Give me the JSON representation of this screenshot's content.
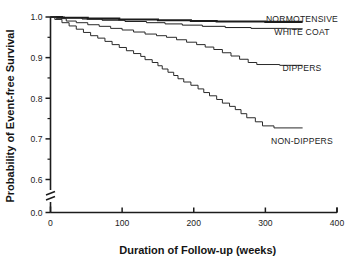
{
  "chart_data": {
    "type": "line",
    "subtype": "kaplan-meier-step",
    "title": "",
    "xlabel": "Duration of Follow-up (weeks)",
    "ylabel": "Probability of Event-free Survival",
    "xlim": [
      0,
      400
    ],
    "ylim": [
      0.55,
      1.0
    ],
    "xticks": [
      0,
      100,
      200,
      300,
      400
    ],
    "xticklabels": [
      "0",
      "100",
      "200",
      "300",
      "400"
    ],
    "yticks": [
      0.6,
      0.7,
      0.8,
      0.9,
      1.0
    ],
    "yticklabels": [
      "0.6",
      "0.7",
      "0.8",
      "0.9",
      "1.0"
    ],
    "y_minor_ticks": [
      0.65,
      0.75,
      0.85,
      0.95
    ],
    "y_axis_break": true,
    "y_break_label": "0.0",
    "grid": false,
    "legend_position": "inline-right-of-curves",
    "series": [
      {
        "name": "NORMOTENSIVE",
        "label": "NORMOTENSIVE",
        "color": "#1c1c1c",
        "linewidth": 2.1,
        "label_x": 302,
        "label_y": 0.995,
        "points": [
          [
            0,
            1.0
          ],
          [
            16,
            1.0
          ],
          [
            16,
            0.998
          ],
          [
            52,
            0.998
          ],
          [
            52,
            0.996
          ],
          [
            96,
            0.996
          ],
          [
            96,
            0.994
          ],
          [
            150,
            0.994
          ],
          [
            150,
            0.992
          ],
          [
            196,
            0.992
          ],
          [
            196,
            0.99
          ],
          [
            232,
            0.99
          ],
          [
            232,
            0.989
          ],
          [
            300,
            0.989
          ],
          [
            300,
            0.988
          ],
          [
            352,
            0.988
          ]
        ]
      },
      {
        "name": "WHITE COAT",
        "label": "WHITE COAT",
        "color": "#1c1c1c",
        "linewidth": 1.0,
        "label_x": 302,
        "label_y": 0.963,
        "points": [
          [
            0,
            1.0
          ],
          [
            20,
            1.0
          ],
          [
            20,
            0.998
          ],
          [
            44,
            0.998
          ],
          [
            44,
            0.995
          ],
          [
            72,
            0.995
          ],
          [
            72,
            0.992
          ],
          [
            104,
            0.992
          ],
          [
            104,
            0.989
          ],
          [
            134,
            0.989
          ],
          [
            134,
            0.986
          ],
          [
            160,
            0.986
          ],
          [
            160,
            0.983
          ],
          [
            184,
            0.983
          ],
          [
            184,
            0.98
          ],
          [
            212,
            0.98
          ],
          [
            212,
            0.977
          ],
          [
            244,
            0.977
          ],
          [
            244,
            0.974
          ],
          [
            280,
            0.974
          ],
          [
            280,
            0.972
          ],
          [
            330,
            0.972
          ],
          [
            330,
            0.971
          ],
          [
            352,
            0.971
          ]
        ]
      },
      {
        "name": "DIPPERS",
        "label": "DIPPERS",
        "color": "#2a2a2a",
        "linewidth": 1.0,
        "label_x": 302,
        "label_y": 0.875,
        "points": [
          [
            0,
            1.0
          ],
          [
            8,
            1.0
          ],
          [
            8,
            0.996
          ],
          [
            22,
            0.996
          ],
          [
            22,
            0.99
          ],
          [
            36,
            0.99
          ],
          [
            36,
            0.986
          ],
          [
            52,
            0.986
          ],
          [
            52,
            0.981
          ],
          [
            68,
            0.981
          ],
          [
            68,
            0.977
          ],
          [
            84,
            0.977
          ],
          [
            84,
            0.972
          ],
          [
            100,
            0.972
          ],
          [
            100,
            0.968
          ],
          [
            116,
            0.968
          ],
          [
            116,
            0.963
          ],
          [
            132,
            0.963
          ],
          [
            132,
            0.958
          ],
          [
            148,
            0.958
          ],
          [
            148,
            0.954
          ],
          [
            162,
            0.954
          ],
          [
            162,
            0.95
          ],
          [
            176,
            0.95
          ],
          [
            176,
            0.944
          ],
          [
            190,
            0.944
          ],
          [
            190,
            0.938
          ],
          [
            204,
            0.938
          ],
          [
            204,
            0.932
          ],
          [
            216,
            0.932
          ],
          [
            216,
            0.926
          ],
          [
            228,
            0.926
          ],
          [
            228,
            0.92
          ],
          [
            240,
            0.92
          ],
          [
            240,
            0.912
          ],
          [
            252,
            0.912
          ],
          [
            252,
            0.904
          ],
          [
            264,
            0.904
          ],
          [
            264,
            0.896
          ],
          [
            276,
            0.896
          ],
          [
            276,
            0.888
          ],
          [
            288,
            0.888
          ],
          [
            288,
            0.883
          ],
          [
            320,
            0.883
          ],
          [
            320,
            0.881
          ],
          [
            352,
            0.881
          ]
        ]
      },
      {
        "name": "NON-DIPPERS",
        "label": "NON-DIPPERS",
        "color": "#2a2a2a",
        "linewidth": 1.0,
        "label_x": 302,
        "label_y": 0.695,
        "points": [
          [
            0,
            1.0
          ],
          [
            6,
            1.0
          ],
          [
            6,
            0.994
          ],
          [
            16,
            0.994
          ],
          [
            16,
            0.986
          ],
          [
            26,
            0.986
          ],
          [
            26,
            0.978
          ],
          [
            36,
            0.978
          ],
          [
            36,
            0.97
          ],
          [
            46,
            0.97
          ],
          [
            46,
            0.962
          ],
          [
            56,
            0.962
          ],
          [
            56,
            0.954
          ],
          [
            66,
            0.954
          ],
          [
            66,
            0.948
          ],
          [
            76,
            0.948
          ],
          [
            76,
            0.94
          ],
          [
            86,
            0.94
          ],
          [
            86,
            0.932
          ],
          [
            96,
            0.932
          ],
          [
            96,
            0.925
          ],
          [
            106,
            0.925
          ],
          [
            106,
            0.917
          ],
          [
            116,
            0.917
          ],
          [
            116,
            0.91
          ],
          [
            126,
            0.91
          ],
          [
            126,
            0.903
          ],
          [
            132,
            0.903
          ],
          [
            132,
            0.895
          ],
          [
            142,
            0.895
          ],
          [
            142,
            0.888
          ],
          [
            150,
            0.888
          ],
          [
            150,
            0.88
          ],
          [
            156,
            0.88
          ],
          [
            156,
            0.872
          ],
          [
            164,
            0.872
          ],
          [
            164,
            0.864
          ],
          [
            172,
            0.864
          ],
          [
            172,
            0.856
          ],
          [
            178,
            0.856
          ],
          [
            178,
            0.848
          ],
          [
            186,
            0.848
          ],
          [
            186,
            0.84
          ],
          [
            196,
            0.84
          ],
          [
            196,
            0.832
          ],
          [
            206,
            0.832
          ],
          [
            206,
            0.823
          ],
          [
            214,
            0.823
          ],
          [
            214,
            0.814
          ],
          [
            222,
            0.814
          ],
          [
            222,
            0.806
          ],
          [
            232,
            0.806
          ],
          [
            232,
            0.797
          ],
          [
            240,
            0.797
          ],
          [
            240,
            0.788
          ],
          [
            250,
            0.788
          ],
          [
            250,
            0.78
          ],
          [
            258,
            0.78
          ],
          [
            258,
            0.772
          ],
          [
            266,
            0.772
          ],
          [
            266,
            0.762
          ],
          [
            274,
            0.762
          ],
          [
            274,
            0.752
          ],
          [
            286,
            0.752
          ],
          [
            286,
            0.742
          ],
          [
            296,
            0.742
          ],
          [
            296,
            0.732
          ],
          [
            312,
            0.732
          ],
          [
            312,
            0.727
          ],
          [
            352,
            0.727
          ]
        ]
      }
    ]
  },
  "axes": {
    "x_axis_label": "Duration of Follow-up (weeks)",
    "y_axis_label": "Probability of Event-free Survival",
    "origin_label": "0.0"
  }
}
